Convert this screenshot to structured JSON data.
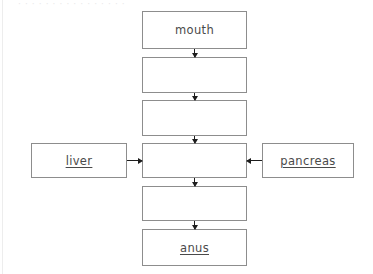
{
  "page": {
    "background_color": "#ffffff",
    "box_border_color": "#8d8d8d",
    "text_color": "#4a4a4a",
    "arrow_color": "#1d1d1d",
    "top_artifact_text": "· · · · · · · · · · · · · · · ·"
  },
  "diagram": {
    "main_column": [
      {
        "id": "mouth",
        "label": "mouth",
        "underlined": false,
        "x": 142,
        "y": 11,
        "w": 105,
        "h": 38
      },
      {
        "id": "blank1",
        "label": "",
        "underlined": false,
        "x": 142,
        "y": 57,
        "w": 105,
        "h": 36
      },
      {
        "id": "blank2",
        "label": "",
        "underlined": false,
        "x": 142,
        "y": 100,
        "w": 105,
        "h": 36
      },
      {
        "id": "blank3",
        "label": "",
        "underlined": false,
        "x": 142,
        "y": 143,
        "w": 105,
        "h": 35
      },
      {
        "id": "blank4",
        "label": "",
        "underlined": false,
        "x": 142,
        "y": 186,
        "w": 105,
        "h": 35
      },
      {
        "id": "anus",
        "label": "anus",
        "underlined": true,
        "x": 142,
        "y": 229,
        "w": 105,
        "h": 37
      }
    ],
    "side_boxes": [
      {
        "id": "liver",
        "label": "liver",
        "underlined": true,
        "x": 31,
        "y": 143,
        "w": 96,
        "h": 35,
        "arrow": "right"
      },
      {
        "id": "pancreas",
        "label": "pancreas",
        "underlined": true,
        "x": 262,
        "y": 143,
        "w": 92,
        "h": 35,
        "arrow": "left"
      }
    ],
    "vertical_arrows": [
      {
        "id": "arrow-mouth-to-blank1",
        "x": 194,
        "y": 49,
        "len": 8
      },
      {
        "id": "arrow-blank1-to-blank2",
        "x": 194,
        "y": 93,
        "len": 7
      },
      {
        "id": "arrow-blank2-to-blank3",
        "x": 194,
        "y": 136,
        "len": 7
      },
      {
        "id": "arrow-blank3-to-blank4",
        "x": 194,
        "y": 178,
        "len": 8
      },
      {
        "id": "arrow-blank4-to-anus",
        "x": 194,
        "y": 221,
        "len": 8
      }
    ],
    "horizontal_arrows": [
      {
        "id": "arrow-liver-to-center",
        "dir": "right",
        "x": 127,
        "y": 160,
        "len": 15
      },
      {
        "id": "arrow-pancreas-to-center",
        "dir": "left",
        "x": 247,
        "y": 160,
        "len": 15
      }
    ]
  }
}
